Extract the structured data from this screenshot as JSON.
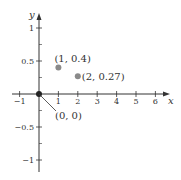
{
  "chart_data": {
    "type": "scatter",
    "title": "",
    "xlabel": "x",
    "ylabel": "y",
    "xlim": [
      -1.5,
      6.8
    ],
    "ylim": [
      -1.1,
      1.25
    ],
    "grid": false,
    "x_ticks": [
      -1,
      1,
      2,
      3,
      4,
      5,
      6
    ],
    "x_tick_labels": [
      "−1",
      "1",
      "2",
      "3",
      "4",
      "5",
      "6"
    ],
    "y_major_ticks": [
      1,
      0.5,
      -0.5,
      -1
    ],
    "y_tick_labels": [
      "1",
      "0.5",
      "−0.5",
      "−1"
    ],
    "y_minor_ticks": [
      0.75,
      0.25,
      -0.25,
      -0.75
    ],
    "series": [
      {
        "name": "points",
        "points": [
          {
            "x": 0,
            "y": 0,
            "label": "(0, 0)"
          },
          {
            "x": 1,
            "y": 0.4,
            "label": "(1, 0.4)"
          },
          {
            "x": 2,
            "y": 0.27,
            "label": "(2, 0.27)"
          }
        ]
      }
    ],
    "colors": {
      "axis": "#333333",
      "origin_point": "#222222",
      "data_point": "#8a8a8a"
    }
  }
}
